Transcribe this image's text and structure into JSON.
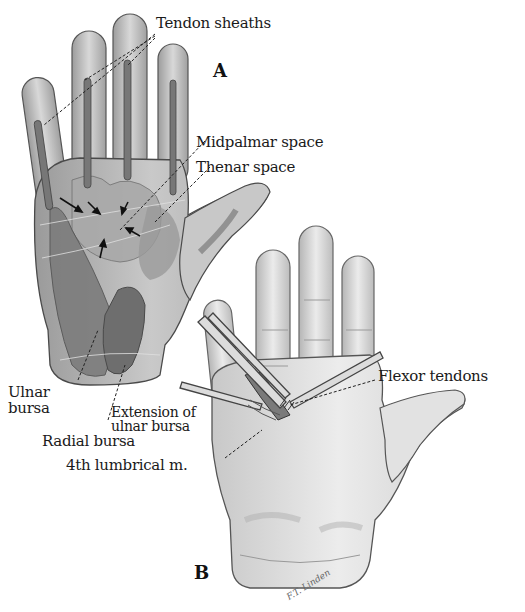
{
  "figure": {
    "panels": [
      {
        "id": "A",
        "letter": "A"
      },
      {
        "id": "B",
        "letter": "B"
      }
    ],
    "labels": {
      "tendon_sheaths": "Tendon sheaths",
      "midpalmar_space": "Midpalmar space",
      "thenar_space": "Thenar space",
      "ulnar_bursa_line1": "Ulnar",
      "ulnar_bursa_line2": "bursa",
      "radial_bursa": "Radial bursa",
      "extension_line1": "Extension of",
      "extension_line2": "ulnar bursa",
      "fourth_lumbrical": "4th lumbrical m.",
      "flexor_tendons": "Flexor tendons"
    },
    "signature": "F.T. Linden",
    "colors": {
      "background": "#ffffff",
      "skin_light": "#e6e6e6",
      "skin_mid": "#c4c4c4",
      "shade_dark": "#8a8a8a",
      "bursa_dark": "#6e6e6e",
      "outline": "#4a4a4a",
      "text": "#1a1a1a"
    }
  }
}
